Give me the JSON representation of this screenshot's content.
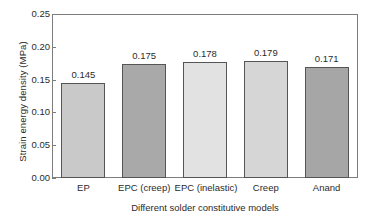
{
  "chart_data": {
    "type": "bar",
    "title": "",
    "xlabel": "Different solder constitutive models",
    "ylabel": "Strain energy density (MPa)",
    "categories": [
      "EP",
      "EPC (creep)",
      "EPC (inelastic)",
      "Creep",
      "Anand"
    ],
    "values": [
      0.145,
      0.175,
      0.178,
      0.179,
      0.171
    ],
    "value_labels": [
      "0.145",
      "0.175",
      "0.178",
      "0.179",
      "0.171"
    ],
    "bar_colors": [
      "#c9c9c9",
      "#a9a9a9",
      "#e2e2e2",
      "#d6d6d6",
      "#a6a6a6"
    ],
    "bar_edge_color": "#555555",
    "ylim": [
      0.0,
      0.25
    ],
    "ytick_values": [
      0.25,
      0.2,
      0.15,
      0.1,
      0.05,
      0.0
    ],
    "ytick_labels": [
      "0.25",
      "0.20",
      "0.15",
      "0.10",
      "0.05",
      "0.00"
    ],
    "grid": false,
    "legend": false,
    "frame_color": "#7d7d7d",
    "background": "#ffffff"
  }
}
